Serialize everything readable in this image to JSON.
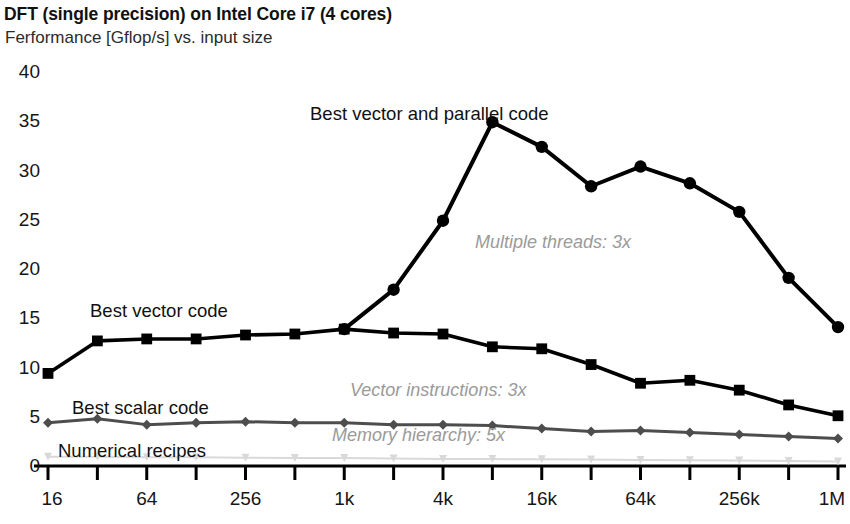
{
  "chart_data": {
    "type": "line",
    "title": "DFT (single precision) on Intel Core i7 (4 cores)",
    "subtitle": "Ferformance [Gflop/s] vs. input size",
    "xlabel": "",
    "ylabel": "",
    "grid": false,
    "legend_position": "inline-annotations",
    "ylim": [
      0,
      41
    ],
    "yticks": [
      0,
      5,
      10,
      15,
      20,
      25,
      30,
      35,
      40
    ],
    "ytick_labels": [
      "0",
      "5",
      "10",
      "15",
      "20",
      "25",
      "30",
      "35",
      "40"
    ],
    "x": [
      16,
      32,
      64,
      128,
      256,
      512,
      1024,
      2048,
      4096,
      8192,
      16384,
      32768,
      65536,
      131072,
      262144,
      524288,
      1048576
    ],
    "xtick_labels": [
      "16",
      "",
      "64",
      "",
      "256",
      "",
      "1k",
      "",
      "4k",
      "",
      "16k",
      "",
      "64k",
      "",
      "256k",
      "",
      "1M"
    ],
    "xtick_labels_shown": [
      "16",
      "64",
      "256",
      "1k",
      "4k",
      "16k",
      "64k",
      "256k",
      "1M"
    ],
    "series": [
      {
        "name": "Best vector and parallel code",
        "color": "#000000",
        "marker": "circle",
        "values": [
          null,
          null,
          null,
          null,
          null,
          null,
          13.9,
          17.9,
          24.9,
          34.9,
          32.4,
          28.4,
          30.4,
          28.7,
          25.8,
          19.1,
          14.1
        ]
      },
      {
        "name": "Best vector code",
        "color": "#000000",
        "marker": "square",
        "values": [
          9.4,
          12.7,
          12.9,
          12.9,
          13.3,
          13.4,
          13.9,
          13.5,
          13.4,
          12.1,
          11.9,
          10.3,
          8.4,
          8.7,
          7.7,
          6.2,
          5.1
        ]
      },
      {
        "name": "Best scalar code",
        "color": "#4d4d4d",
        "marker": "diamond",
        "values": [
          4.4,
          4.8,
          4.2,
          4.4,
          4.5,
          4.4,
          4.4,
          4.2,
          4.2,
          4.1,
          3.8,
          3.5,
          3.6,
          3.4,
          3.2,
          3.0,
          2.8
        ]
      },
      {
        "name": "Numerical recipes",
        "color": "#d9d9d9",
        "marker": "triangle",
        "values": [
          0.95,
          0.95,
          0.9,
          0.9,
          0.85,
          0.8,
          0.8,
          0.75,
          0.72,
          0.7,
          0.68,
          0.65,
          0.6,
          0.58,
          0.55,
          0.5,
          0.45
        ]
      }
    ],
    "series_labels": [
      {
        "text": "Best vector and parallel code",
        "x_px": 310,
        "y_px": 103,
        "color": "#111111",
        "italic": false
      },
      {
        "text": "Best vector code",
        "x_px": 90,
        "y_px": 300,
        "color": "#111111",
        "italic": false
      },
      {
        "text": "Best scalar code",
        "x_px": 72,
        "y_px": 397,
        "color": "#111111",
        "italic": false
      },
      {
        "text": "Numerical recipes",
        "x_px": 58,
        "y_px": 440,
        "color": "#111111",
        "italic": false
      }
    ],
    "annotations": [
      {
        "text": "Multiple threads: 3x",
        "x_px": 475,
        "y_px": 232,
        "color": "#9a9a9a",
        "italic": true
      },
      {
        "text": "Vector instructions: 3x",
        "x_px": 350,
        "y_px": 380,
        "color": "#9a9a9a",
        "italic": true
      },
      {
        "text": "Memory hierarchy: 5x",
        "x_px": 332,
        "y_px": 425,
        "color": "#9a9a9a",
        "italic": true
      }
    ]
  },
  "colors": {
    "background": "#ffffff",
    "axis": "#000000",
    "parallel_series": "#000000",
    "vector_series": "#000000",
    "scalar_series": "#4d4d4d",
    "numerical_recipes_series": "#d9d9d9",
    "annotation_gray": "#9a9a9a"
  }
}
